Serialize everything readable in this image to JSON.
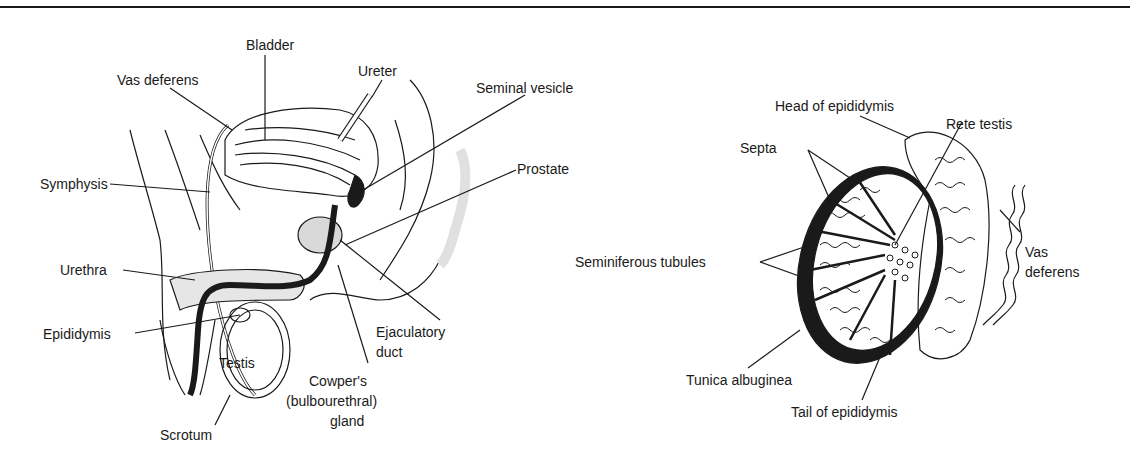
{
  "figure": {
    "left_panel": {
      "name": "Male reproductive system, sagittal section",
      "labels": {
        "bladder": "Bladder",
        "vas_deferens": "Vas deferens",
        "ureter": "Ureter",
        "seminal_vesicle": "Seminal vesicle",
        "symphysis": "Symphysis",
        "prostate": "Prostate",
        "urethra": "Urethra",
        "epididymis": "Epididymis",
        "testis": "Testis",
        "scrotum": "Scrotum",
        "ejaculatory_duct_1": "Ejaculatory",
        "ejaculatory_duct_2": "duct",
        "cowpers_1": "Cowper's",
        "cowpers_2": "(bulbourethral)",
        "cowpers_3": "gland"
      }
    },
    "right_panel": {
      "name": "Testis cross-section",
      "labels": {
        "head_of_epididymis": "Head of epididymis",
        "rete_testis": "Rete testis",
        "septa": "Septa",
        "seminiferous_tubules": "Seminiferous tubules",
        "vas_deferens_1": "Vas",
        "vas_deferens_2": "deferens",
        "tunica_albuginea": "Tunica albuginea",
        "tail_of_epididymis": "Tail of epididymis"
      }
    },
    "colors": {
      "ink": "#1a1a1a",
      "paper": "#ffffff",
      "stipple": "#bdbdbd"
    }
  }
}
